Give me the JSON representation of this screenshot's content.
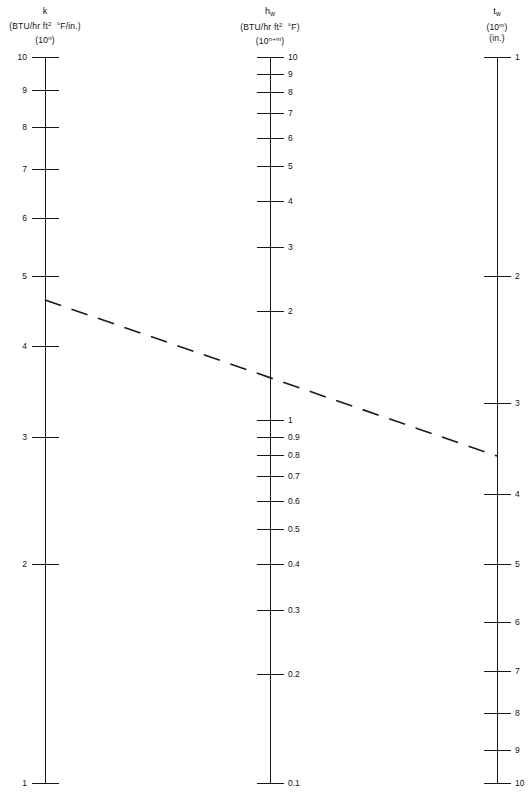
{
  "figure": {
    "type": "nomogram",
    "background_color": "#ffffff",
    "line_color": "#1a1a1a",
    "width": 530,
    "height": 797
  },
  "axes": {
    "left": {
      "name": "k-axis",
      "symbol": "k",
      "symbol_html": "k",
      "units": "(BTU/hr ft2 °F/in.)",
      "decade": "(10n)",
      "scale_type": "log",
      "top_value": 10,
      "bottom_value": 1,
      "direction": "decreasing-downward",
      "x": 45,
      "y_top": 57,
      "y_bottom": 783,
      "tick_side": "left",
      "label_side": "left",
      "major_labels": [
        "10",
        "9",
        "8",
        "7",
        "6",
        "5",
        "4",
        "3",
        "2",
        "1"
      ],
      "major_values": [
        10,
        9,
        8,
        7,
        6,
        5,
        4,
        3,
        2,
        1
      ]
    },
    "middle": {
      "name": "hw-axis",
      "symbol": "h_w",
      "units": "(BTU/hr ft2 °F)",
      "decade": "(10n+m)",
      "scale_type": "log",
      "top_value": 10,
      "bottom_value": 0.1,
      "decades": 2,
      "direction": "decreasing-downward",
      "x": 270,
      "y_top": 57,
      "y_bottom": 783,
      "tick_side": "right",
      "label_side": "right",
      "major_labels": [
        "10",
        "9",
        "8",
        "7",
        "6",
        "5",
        "4",
        "3",
        "2",
        "1",
        "0.9",
        "0.8",
        "0.7",
        "0.6",
        "0.5",
        "0.4",
        "0.3",
        "0.2",
        "0.1"
      ],
      "major_values": [
        10,
        9,
        8,
        7,
        6,
        5,
        4,
        3,
        2,
        1,
        0.9,
        0.8,
        0.7,
        0.6,
        0.5,
        0.4,
        0.3,
        0.2,
        0.1
      ]
    },
    "right": {
      "name": "tw-axis",
      "symbol": "t_w",
      "decade": "(10m)",
      "units": "(in.)",
      "scale_type": "log-inverted",
      "top_value": 1,
      "bottom_value": 10,
      "direction": "increasing-downward",
      "x": 497,
      "y_top": 57,
      "y_bottom": 783,
      "tick_side": "right",
      "label_side": "right",
      "major_labels": [
        "1",
        "2",
        "3",
        "4",
        "5",
        "6",
        "7",
        "8",
        "9",
        "10"
      ],
      "major_values": [
        1,
        2,
        3,
        4,
        5,
        6,
        7,
        8,
        9,
        10
      ]
    }
  },
  "isopleth": {
    "name": "example-isopleth",
    "style": "dashed",
    "points": [
      {
        "axis": "left",
        "x": 45,
        "y": 300,
        "value": 4.6
      },
      {
        "axis": "middle",
        "x": 270,
        "y": 378,
        "value": 1.45
      },
      {
        "axis": "right",
        "x": 497,
        "y": 456,
        "value": 3.45
      }
    ]
  },
  "chart_data": {
    "type": "line",
    "title": "",
    "subtitle": "",
    "xlabel": "",
    "ylabel": "",
    "grid": false,
    "legend": "none",
    "scales": [
      {
        "name": "k",
        "label": "k (BTU/hr ft² °F/in.) (10ⁿ)",
        "type": "log",
        "range": [
          1,
          10
        ],
        "orientation": "vertical-descending",
        "ticks": [
          10,
          9,
          8,
          7,
          6,
          5,
          4,
          3,
          2,
          1
        ]
      },
      {
        "name": "h_w",
        "label": "h_w (BTU/hr ft² °F) (10ⁿ⁺ᵐ)",
        "type": "log",
        "range": [
          0.1,
          10
        ],
        "orientation": "vertical-descending",
        "ticks": [
          10,
          9,
          8,
          7,
          6,
          5,
          4,
          3,
          2,
          1,
          0.9,
          0.8,
          0.7,
          0.6,
          0.5,
          0.4,
          0.3,
          0.2,
          0.1
        ]
      },
      {
        "name": "t_w",
        "label": "t_w (10ᵐ) (in.)",
        "type": "log",
        "range": [
          1,
          10
        ],
        "orientation": "vertical-ascending",
        "ticks": [
          1,
          2,
          3,
          4,
          5,
          6,
          7,
          8,
          9,
          10
        ]
      }
    ],
    "series": [
      {
        "name": "isopleth",
        "style": "dashed",
        "readings": {
          "k": 4.6,
          "h_w": 1.45,
          "t_w": 3.45
        }
      }
    ]
  }
}
